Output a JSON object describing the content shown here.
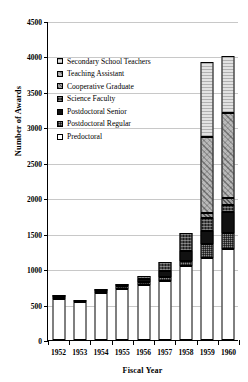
{
  "chart_data": {
    "type": "bar",
    "subtype": "stacked",
    "title": "",
    "xlabel": "Fiscal Year",
    "ylabel": "Number of Awards",
    "categories": [
      "1952",
      "1953",
      "1954",
      "1955",
      "1956",
      "1957",
      "1958",
      "1959",
      "1960"
    ],
    "ylim": [
      0,
      4500
    ],
    "yticks": [
      0,
      500,
      1000,
      1500,
      2000,
      2500,
      3000,
      3500,
      4000,
      4500
    ],
    "ytick_labels": [
      "0",
      "500",
      "1000",
      "1500",
      "2000",
      "2500",
      "3000",
      "3500",
      "4000",
      "4500"
    ],
    "grid": true,
    "legend_position": "upper-left-inside",
    "stack_order_bottom_to_top": [
      "Predoctoral",
      "Postdoctoral Regular",
      "Postdoctoral Senior",
      "Science Faculty",
      "Cooperative Graduate",
      "Teaching Assistant",
      "Secondary School Teachers"
    ],
    "series": [
      {
        "name": "Predoctoral",
        "values": [
          575,
          535,
          665,
          720,
          775,
          835,
          1050,
          1150,
          1290
        ]
      },
      {
        "name": "Postdoctoral Regular",
        "values": [
          25,
          20,
          20,
          40,
          50,
          55,
          65,
          200,
          220
        ]
      },
      {
        "name": "Postdoctoral Senior",
        "values": [
          20,
          0,
          15,
          10,
          40,
          85,
          145,
          190,
          290
        ]
      },
      {
        "name": "Science Faculty",
        "values": [
          0,
          0,
          0,
          0,
          45,
          120,
          255,
          180,
          100
        ]
      },
      {
        "name": "Cooperative Graduate",
        "values": [
          0,
          0,
          0,
          0,
          0,
          0,
          0,
          70,
          100
        ]
      },
      {
        "name": "Teaching Assistant",
        "values": [
          0,
          0,
          0,
          0,
          0,
          0,
          0,
          1075,
          1200
        ]
      },
      {
        "name": "Secondary School Teachers",
        "values": [
          0,
          0,
          0,
          0,
          0,
          0,
          0,
          1060,
          800
        ]
      }
    ],
    "totals": [
      620,
      555,
      700,
      770,
      910,
      1095,
      1515,
      3925,
      4000
    ]
  },
  "legend": {
    "items": [
      {
        "label": "Secondary School Teachers",
        "key": "secondary-school-teachers"
      },
      {
        "label": "Teaching Assistant",
        "key": "teaching-assistant"
      },
      {
        "label": "Cooperative Graduate",
        "key": "cooperative-graduate"
      },
      {
        "label": "Science Faculty",
        "key": "science-faculty"
      },
      {
        "label": "Postdoctoral Senior",
        "key": "postdoc-senior"
      },
      {
        "label": "Postdoctoral Regular",
        "key": "postdoc-regular"
      },
      {
        "label": "Predoctoral",
        "key": "predoctoral"
      }
    ]
  },
  "colors": {
    "axis": "#000000",
    "gridline": "#c8c8c8",
    "background": "#ffffff"
  }
}
